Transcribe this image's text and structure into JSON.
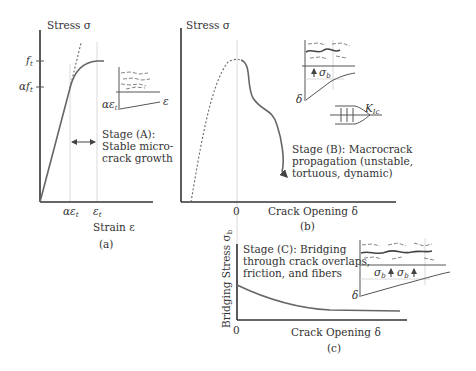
{
  "panel_a": {
    "caption": "(a)",
    "y_axis_label": "Stress σ",
    "x_axis_label": "Strain ε",
    "y_ticks": [
      "f_t",
      "αf_t"
    ],
    "y_tick_main": "f",
    "y_tick_alpha": "αf",
    "sub_t": "t",
    "x_ticks": [
      "αε_t",
      "ε_t"
    ],
    "x_tick_alpha": "αε",
    "x_tick_eps": "ε",
    "inset_y_label": "αε",
    "inset_x_label": "ε",
    "stage_line1": "Stage (A):",
    "stage_line2": "Stable micro-",
    "stage_line3": "crack growth"
  },
  "panel_b": {
    "caption": "(b)",
    "y_axis_label": "Stress σ",
    "x_axis_label": "Crack Opening δ",
    "x_origin": "0",
    "inset_sigma": "σ",
    "inset_sub_b": "b",
    "inset_delta": "δ",
    "kic_label": "K",
    "kic_sub": "Ic",
    "stage_line1": "Stage (B): Macrocrack",
    "stage_line2": "propagation (unstable,",
    "stage_line3": "tortuous, dynamic)"
  },
  "panel_c": {
    "caption": "(c)",
    "y_axis_label": "Bridging Stress σ",
    "y_axis_sub": "b",
    "x_axis_label": "Crack Opening δ",
    "x_origin": "0",
    "inset_sigma": "σ",
    "inset_sub_b": "b",
    "inset_delta": "δ",
    "stage_line1": "Stage (C): Bridging",
    "stage_line2": "through crack overlaps,",
    "stage_line3": "friction, and fibers"
  }
}
